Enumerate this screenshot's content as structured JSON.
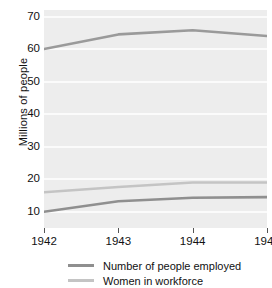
{
  "chart_data": {
    "type": "line",
    "title": "",
    "xlabel": "",
    "ylabel": "Millions of people",
    "x": [
      1942,
      1943,
      1944,
      1945
    ],
    "xtick_labels": [
      "1942",
      "1943",
      "1944",
      "1945"
    ],
    "ytick_labels": [
      "10",
      "20",
      "30",
      "40",
      "50",
      "60",
      "70"
    ],
    "yticks": [
      10,
      20,
      30,
      40,
      50,
      60,
      70
    ],
    "ylim": [
      5,
      72
    ],
    "xlim": [
      1942,
      1945
    ],
    "grid": true,
    "legend_position": "bottom",
    "series": [
      {
        "name": "Number of people employed",
        "values": [
          60.0,
          64.5,
          65.8,
          64.0
        ],
        "color": "#9a9a9a"
      },
      {
        "name": "Women in workforce",
        "values": [
          16.0,
          17.6,
          19.0,
          19.0
        ],
        "color": "#c4c4c4"
      },
      {
        "name": "Number of people employed (lower)",
        "values": [
          10.0,
          13.2,
          14.3,
          14.5
        ],
        "color": "#8f8f8f"
      }
    ]
  },
  "axes": {
    "y_title": "Millions of people",
    "y_labels": [
      "70",
      "60",
      "50",
      "40",
      "30",
      "20",
      "10"
    ],
    "x_labels": [
      "1942",
      "1943",
      "1944",
      "1945"
    ]
  },
  "legend": {
    "items": [
      {
        "label": "Number of people employed",
        "color": "#8f8f8f"
      },
      {
        "label": "Women in workforce",
        "color": "#c4c4c4"
      }
    ]
  },
  "colors": {
    "plot_background": "#ededed",
    "gridline": "#fbfbfb",
    "series_dark": "#8f8f8f",
    "series_light": "#c4c4c4",
    "text": "#111111"
  }
}
